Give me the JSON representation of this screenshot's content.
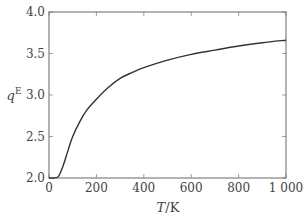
{
  "chart_data": {
    "type": "line",
    "title": "",
    "xlabel": "T/K",
    "ylabel": "q^E",
    "xlim": [
      0,
      1000
    ],
    "ylim": [
      2.0,
      4.0
    ],
    "grid": false,
    "legend": null,
    "x_ticks": [
      0,
      200,
      400,
      600,
      800,
      1000
    ],
    "x_tick_labels": [
      "0",
      "200",
      "400",
      "600",
      "800",
      "1 000"
    ],
    "y_ticks": [
      2.0,
      2.5,
      3.0,
      3.5,
      4.0
    ],
    "y_tick_labels": [
      "2.0",
      "2.5",
      "3.0",
      "3.5",
      "4.0"
    ],
    "series": [
      {
        "name": "q^E",
        "color": "#333333",
        "x": [
          0,
          20,
          40,
          60,
          80,
          100,
          130,
          160,
          200,
          250,
          300,
          350,
          400,
          500,
          600,
          700,
          800,
          900,
          1000
        ],
        "y": [
          2.0,
          2.0,
          2.02,
          2.15,
          2.33,
          2.5,
          2.68,
          2.82,
          2.95,
          3.09,
          3.2,
          3.27,
          3.33,
          3.42,
          3.49,
          3.54,
          3.59,
          3.63,
          3.66
        ]
      }
    ]
  }
}
